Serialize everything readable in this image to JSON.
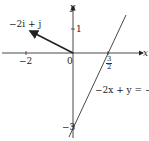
{
  "diagram": {
    "axes": {
      "x_label": "x",
      "y_label": "y"
    },
    "ticks": {
      "x_neg2": "−2",
      "origin": "0",
      "y_pos1": "1",
      "y_neg3": "−3",
      "x_frac_num": "3",
      "x_frac_den": "2"
    },
    "vector": {
      "label": "−2i + j",
      "from": [
        0,
        0
      ],
      "to": [
        -2,
        1
      ]
    },
    "line": {
      "label": "−2x + y = −3",
      "equation": "y = 2x − 3"
    },
    "colors": {
      "ink": "#222222",
      "background": "#ffffff"
    }
  }
}
